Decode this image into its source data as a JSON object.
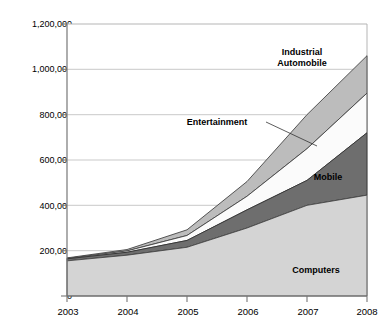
{
  "chart_data": {
    "type": "area",
    "stacked": true,
    "title": "",
    "xlabel": "",
    "ylabel": "",
    "x": [
      2003,
      2004,
      2005,
      2006,
      2007,
      2008
    ],
    "categories": [
      "2003",
      "2004",
      "2005",
      "2006",
      "2007",
      "2008"
    ],
    "xtick_labels": [
      "2003",
      "2004",
      "2005",
      "2006",
      "2007",
      "2008"
    ],
    "ytick_labels": [
      "0",
      "200,000",
      "400,000",
      "600,000",
      "800,000",
      "1,000,000",
      "1,200,000"
    ],
    "ytick_values": [
      0,
      200000,
      400000,
      600000,
      800000,
      1000000,
      1200000
    ],
    "ylim": [
      0,
      1200000
    ],
    "xlim": [
      2003,
      2008
    ],
    "grid": "horizontal",
    "legend_position": "in-plot-annotations",
    "series": [
      {
        "name": "Computers",
        "color": "#d4d4d4",
        "values": [
          155000,
          180000,
          215000,
          300000,
          400000,
          445000
        ]
      },
      {
        "name": "Mobile",
        "color": "#6e6e6e",
        "values": [
          9000,
          13000,
          30000,
          80000,
          110000,
          275000
        ]
      },
      {
        "name": "Entertainment",
        "color": "#fbfbfb",
        "values": [
          2000,
          6000,
          22000,
          60000,
          140000,
          175000
        ]
      },
      {
        "name": "Industrial Automobile",
        "color": "#bcbcbc",
        "values": [
          2000,
          6000,
          25000,
          65000,
          150000,
          165000
        ]
      }
    ],
    "cumulative_totals": [
      168000,
      205000,
      292000,
      505000,
      800000,
      1060000
    ],
    "annotations": [
      {
        "text": "Industrial",
        "series": "Industrial Automobile",
        "leader": true
      },
      {
        "text": "Automobile",
        "series": "Industrial Automobile",
        "leader": true
      },
      {
        "text": "Entertainment",
        "series": "Entertainment",
        "leader": true
      },
      {
        "text": "Mobile",
        "series": "Mobile",
        "leader": false
      },
      {
        "text": "Computers",
        "series": "Computers",
        "leader": false
      }
    ]
  },
  "labels": {
    "industrial_line1": "Industrial",
    "industrial_line2": "Automobile",
    "entertainment": "Entertainment",
    "mobile": "Mobile",
    "computers": "Computers"
  },
  "axis": {
    "y": {
      "t0": "0",
      "t1": "200,000",
      "t2": "400,000",
      "t3": "600,000",
      "t4": "800,000",
      "t5": "1,000,000",
      "t6": "1,200,000"
    },
    "x": {
      "t0": "2003",
      "t1": "2004",
      "t2": "2005",
      "t3": "2006",
      "t4": "2007",
      "t5": "2008"
    }
  },
  "colors": {
    "computers": "#d4d4d4",
    "mobile": "#6e6e6e",
    "entertainment": "#fbfbfb",
    "industrial": "#bcbcbc",
    "grid": "#c8c8c8",
    "axis": "#808080",
    "stroke": "#3a3a3a"
  }
}
